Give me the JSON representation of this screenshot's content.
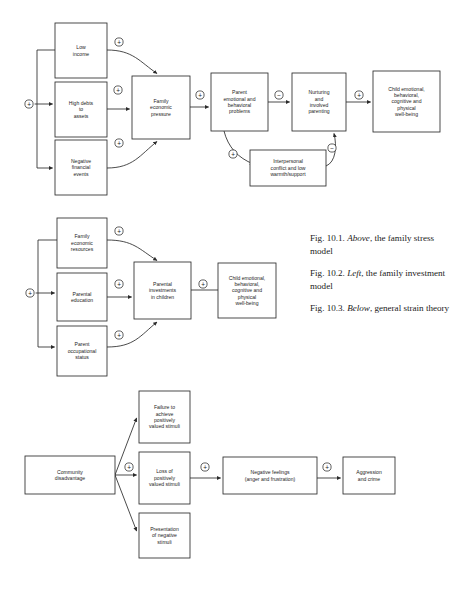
{
  "figure": {
    "page_background": "#ffffff",
    "line_color": "#2b2b2b",
    "text_color": "#1c1c1c"
  },
  "captions": [
    {
      "prefix": "Fig. 10.1. ",
      "emphasis": "Above",
      "suffix": ", the family stress model"
    },
    {
      "prefix": "Fig. 10.2. ",
      "emphasis": "Left",
      "suffix": ", the family investment model"
    },
    {
      "prefix": "Fig. 10.3. ",
      "emphasis": "Below",
      "suffix": ", general strain theory"
    }
  ],
  "diagram_top": {
    "name": "family-stress-model",
    "nodes": [
      {
        "id": "low-income",
        "lines": [
          "Low",
          "income"
        ]
      },
      {
        "id": "high-debts",
        "lines": [
          "High debts",
          "to",
          "assets"
        ]
      },
      {
        "id": "negative-financial",
        "lines": [
          "Negative",
          "financial",
          "events"
        ]
      },
      {
        "id": "family-economic-pressure",
        "lines": [
          "Family",
          "economic",
          "pressure"
        ]
      },
      {
        "id": "parent-problems",
        "lines": [
          "Parent",
          "emotional and",
          "behavioral",
          "problems"
        ]
      },
      {
        "id": "interpersonal-conflict",
        "lines": [
          "Interpersonal",
          "conflict and low",
          "warmth/support"
        ]
      },
      {
        "id": "nurturing-parenting",
        "lines": [
          "Nurturing",
          "and",
          "involved",
          "parenting"
        ]
      },
      {
        "id": "child-wellbeing",
        "lines": [
          "Child emotional,",
          "behavioral,",
          "cognitive and",
          "physical",
          "well-being"
        ]
      }
    ],
    "signs": [
      {
        "id": "sign-source",
        "symbol": "+"
      },
      {
        "id": "sign-low-income",
        "symbol": "+"
      },
      {
        "id": "sign-high-debts",
        "symbol": "+"
      },
      {
        "id": "sign-negative-events",
        "symbol": "+"
      },
      {
        "id": "sign-pressure-problems",
        "symbol": "+"
      },
      {
        "id": "sign-problems-nurturing",
        "symbol": "−"
      },
      {
        "id": "sign-problems-conflict",
        "symbol": "+"
      },
      {
        "id": "sign-conflict-nurturing",
        "symbol": "−"
      },
      {
        "id": "sign-nurturing-child",
        "symbol": "+"
      }
    ]
  },
  "diagram_middle": {
    "name": "family-investment-model",
    "nodes": [
      {
        "id": "family-economic-resources",
        "lines": [
          "Family",
          "economic",
          "resources"
        ]
      },
      {
        "id": "parental-education",
        "lines": [
          "Parental",
          "education"
        ]
      },
      {
        "id": "parent-occupational-status",
        "lines": [
          "Parent",
          "occupational",
          "status"
        ]
      },
      {
        "id": "parental-investments",
        "lines": [
          "Parental",
          "investments",
          "in children"
        ]
      },
      {
        "id": "child-wellbeing",
        "lines": [
          "Child emotional,",
          "behavioral,",
          "cognitive and",
          "physical",
          "well-being"
        ]
      }
    ],
    "signs": [
      {
        "id": "sign-source",
        "symbol": "+"
      },
      {
        "id": "sign-resources",
        "symbol": "+"
      },
      {
        "id": "sign-education",
        "symbol": "+"
      },
      {
        "id": "sign-occupation",
        "symbol": "+"
      },
      {
        "id": "sign-investments-child",
        "symbol": "+"
      }
    ]
  },
  "diagram_bottom": {
    "name": "general-strain-theory",
    "nodes": [
      {
        "id": "community-disadvantage",
        "lines": [
          "Community",
          "disadvantage"
        ]
      },
      {
        "id": "failure-to-achieve",
        "lines": [
          "Failure to",
          "achieve",
          "positively",
          "valued stimuli"
        ]
      },
      {
        "id": "loss-of-stimuli",
        "lines": [
          "Loss of",
          "positively",
          "valued stimuli"
        ]
      },
      {
        "id": "presentation-negative",
        "lines": [
          "Presentation",
          "of negative",
          "stimuli"
        ]
      },
      {
        "id": "negative-feelings",
        "lines": [
          "Negative feelings",
          "(anger and frustration)"
        ]
      },
      {
        "id": "aggression-crime",
        "lines": [
          "Aggression",
          "and crime"
        ]
      }
    ],
    "signs": [
      {
        "id": "sign-disadvantage",
        "symbol": "+"
      },
      {
        "id": "sign-loss-feelings",
        "symbol": "+"
      },
      {
        "id": "sign-feelings-crime",
        "symbol": "+"
      }
    ]
  }
}
